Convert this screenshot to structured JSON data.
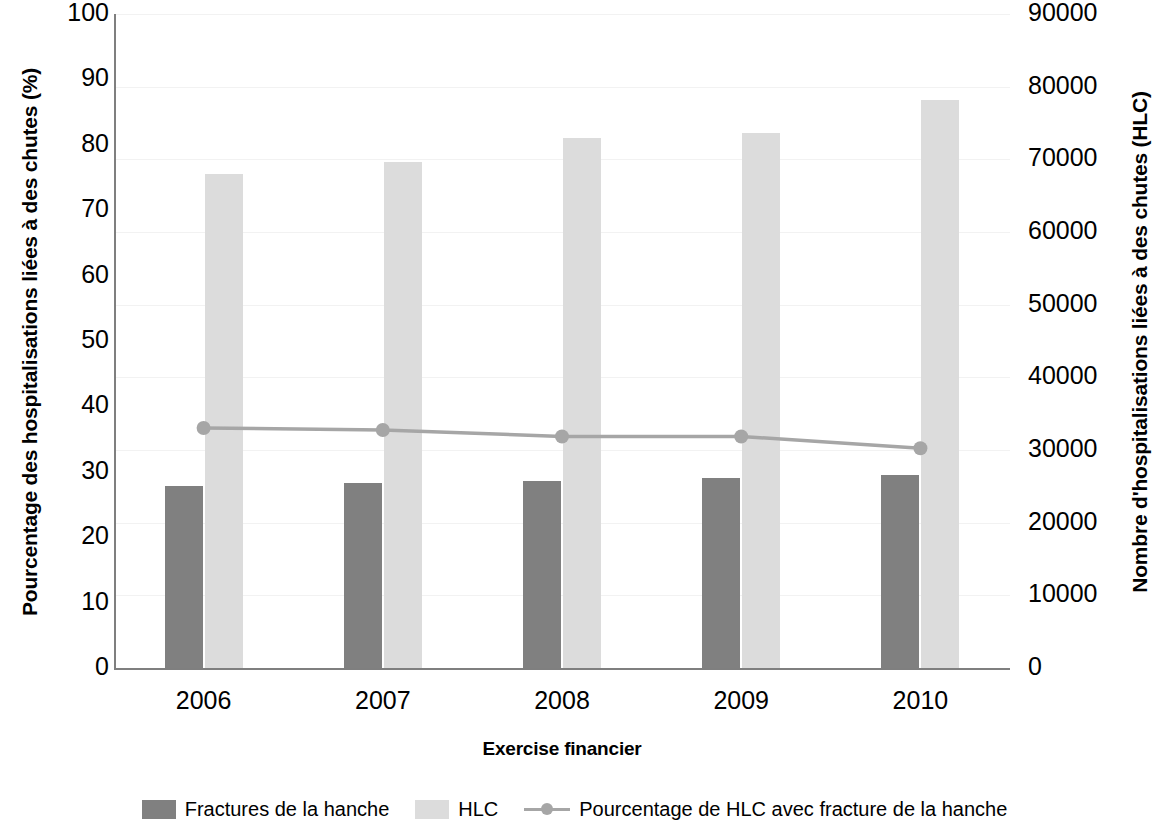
{
  "chart_data": {
    "type": "bar",
    "title": "",
    "xlabel": "Exercise financier",
    "ylabel": "Pourcentage des hospitalisations liées à des chutes (%)",
    "ylabel_right": "Nombre d'hospitalisations liées à des chutes (HLC)",
    "categories": [
      "2006",
      "2007",
      "2008",
      "2009",
      "2010"
    ],
    "ylim": [
      0,
      100
    ],
    "ylim_right": [
      0,
      90000
    ],
    "yticks": [
      "0",
      "10",
      "20",
      "30",
      "40",
      "50",
      "60",
      "70",
      "80",
      "90",
      "100"
    ],
    "yticks_right": [
      "0",
      "10000",
      "20000",
      "30000",
      "40000",
      "50000",
      "60000",
      "70000",
      "80000",
      "90000"
    ],
    "grid": true,
    "legend_position": "bottom",
    "series": [
      {
        "name": "Fractures de la hanche",
        "type": "bar",
        "axis": "right",
        "color": "#808080",
        "values": [
          25000,
          25400,
          25800,
          26200,
          26600
        ]
      },
      {
        "name": "HLC",
        "type": "bar",
        "axis": "right",
        "color": "#dcdcdc",
        "values": [
          68000,
          69600,
          73000,
          73600,
          78200
        ]
      },
      {
        "name": "Pourcentage de HLC avec fracture de la hanche",
        "type": "line",
        "axis": "left",
        "color": "#a6a6a6",
        "values": [
          36.7,
          36.4,
          35.4,
          35.4,
          33.6
        ]
      }
    ]
  },
  "axes": {
    "left_title": "Pourcentage des hospitalisations liées à des chutes (%)",
    "right_title": "Nombre d'hospitalisations liées à des chutes (HLC)",
    "x_title": "Exercise financier"
  },
  "legend": {
    "items": [
      {
        "label": "Fractures de la hanche",
        "marker": "swatch-dark"
      },
      {
        "label": "HLC",
        "marker": "swatch-light"
      },
      {
        "label": "Pourcentage de HLC avec fracture de la hanche",
        "marker": "line-marker"
      }
    ]
  }
}
